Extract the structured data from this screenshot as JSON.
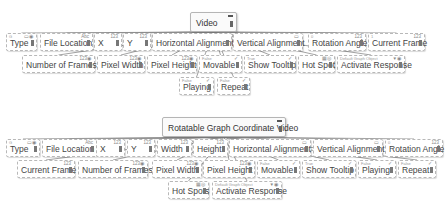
{
  "diagrams": [
    {
      "root": {
        "label": "Video",
        "x": 190,
        "y": 12,
        "w": 47
      },
      "nodes": [
        {
          "label": "Type",
          "hint": "G",
          "tag": "▭◉",
          "x": 6,
          "y": 33,
          "w": 31
        },
        {
          "label": "File Location",
          "hint": "",
          "tag": "Abc",
          "x": 40,
          "y": 33,
          "w": 53
        },
        {
          "label": "X",
          "hint": "",
          "tag": "123",
          "x": 94,
          "y": 33,
          "w": 28
        },
        {
          "label": "Y",
          "hint": "",
          "tag": "123",
          "x": 123,
          "y": 33,
          "w": 28
        },
        {
          "label": "Horizontal Alignment",
          "hint": "",
          "tag": "",
          "x": 152,
          "y": 33,
          "w": 80
        },
        {
          "label": "Vertical Alignment",
          "hint": "",
          "tag": "▭",
          "x": 233,
          "y": 33,
          "w": 70
        },
        {
          "label": "Rotation Angle",
          "hint": "0",
          "tag": "123",
          "x": 308,
          "y": 33,
          "w": 58
        },
        {
          "label": "Current Frame",
          "hint": "1",
          "tag": "123",
          "x": 368,
          "y": 33,
          "w": 57
        },
        {
          "label": "Number of Frames",
          "hint": "",
          "tag": "123◉",
          "x": 22,
          "y": 55,
          "w": 73
        },
        {
          "label": "Pixel Width",
          "hint": "",
          "tag": "123◉",
          "x": 97,
          "y": 55,
          "w": 48
        },
        {
          "label": "Pixel Height",
          "hint": "",
          "tag": "123◉",
          "x": 147,
          "y": 55,
          "w": 50
        },
        {
          "label": "Movable",
          "hint": "False",
          "tag": "✓",
          "x": 199,
          "y": 55,
          "w": 43
        },
        {
          "label": "Show Tooltip",
          "hint": "True",
          "tag": "✓",
          "x": 244,
          "y": 55,
          "w": 52
        },
        {
          "label": "Hot Spot",
          "hint": "",
          "tag": "▦◎",
          "x": 298,
          "y": 55,
          "w": 37
        },
        {
          "label": "Activate Response",
          "hint": "Default Graph Object",
          "tag": "▼◉",
          "x": 337,
          "y": 55,
          "w": 68
        },
        {
          "label": "Playing",
          "hint": "False",
          "tag": "✓",
          "x": 179,
          "y": 77,
          "w": 35
        },
        {
          "label": "Repeat",
          "hint": "False",
          "tag": "✓",
          "x": 217,
          "y": 77,
          "w": 33
        }
      ]
    },
    {
      "root": {
        "label": "Rotatable Graph Coordinate Video",
        "x": 162,
        "y": 117,
        "w": 124
      },
      "nodes": [
        {
          "label": "Type",
          "hint": "G",
          "tag": "▭◉",
          "x": 6,
          "y": 139,
          "w": 34
        },
        {
          "label": "File Location",
          "hint": "",
          "tag": "Abc",
          "x": 42,
          "y": 139,
          "w": 55
        },
        {
          "label": "X",
          "hint": "",
          "tag": "123",
          "x": 96,
          "y": 139,
          "w": 29
        },
        {
          "label": "Y",
          "hint": "",
          "tag": "123",
          "x": 127,
          "y": 139,
          "w": 28
        },
        {
          "label": "Width",
          "hint": "",
          "tag": "123",
          "x": 157,
          "y": 139,
          "w": 35
        },
        {
          "label": "Height",
          "hint": "",
          "tag": "123",
          "x": 193,
          "y": 139,
          "w": 35
        },
        {
          "label": "Horizontal Alignment",
          "hint": "",
          "tag": "▭",
          "x": 229,
          "y": 139,
          "w": 82
        },
        {
          "label": "Vertical Alignment",
          "hint": "",
          "tag": "▭",
          "x": 313,
          "y": 139,
          "w": 70
        },
        {
          "label": "Rotation Angle",
          "hint": "0",
          "tag": "123",
          "x": 385,
          "y": 139,
          "w": 58
        },
        {
          "label": "Current Frame",
          "hint": "",
          "tag": "123",
          "x": 17,
          "y": 160,
          "w": 58
        },
        {
          "label": "Number of Frames",
          "hint": "",
          "tag": "123◉",
          "x": 78,
          "y": 160,
          "w": 70
        },
        {
          "label": "Pixel Width",
          "hint": "",
          "tag": "123◉",
          "x": 152,
          "y": 160,
          "w": 50
        },
        {
          "label": "Pixel Height",
          "hint": "",
          "tag": "123◉",
          "x": 203,
          "y": 160,
          "w": 52
        },
        {
          "label": "Movable",
          "hint": "False",
          "tag": "✓",
          "x": 257,
          "y": 160,
          "w": 43
        },
        {
          "label": "Show Tooltip",
          "hint": "True",
          "tag": "✓",
          "x": 302,
          "y": 160,
          "w": 54
        },
        {
          "label": "Playing",
          "hint": "False",
          "tag": "✓",
          "x": 358,
          "y": 160,
          "w": 38
        },
        {
          "label": "Repeat",
          "hint": "False",
          "tag": "✓",
          "x": 398,
          "y": 160,
          "w": 38
        },
        {
          "label": "Hot Spots",
          "hint": "",
          "tag": "▦◎",
          "x": 168,
          "y": 181,
          "w": 41
        },
        {
          "label": "Activate Response",
          "hint": "Default Graph Object",
          "tag": "▼◉",
          "x": 212,
          "y": 181,
          "w": 70
        }
      ]
    }
  ]
}
